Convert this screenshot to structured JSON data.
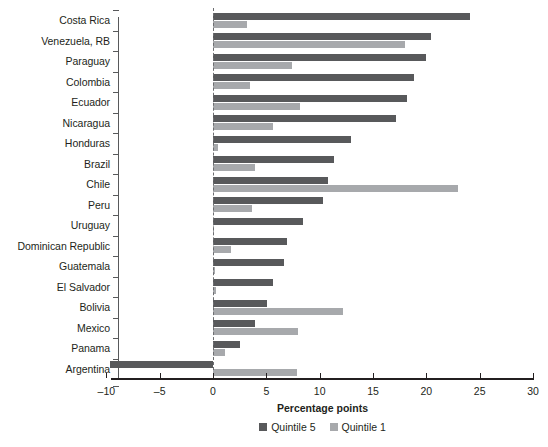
{
  "chart_data": {
    "type": "bar",
    "orientation": "horizontal",
    "title": "",
    "subtitle": "",
    "xlabel": "Percentage points",
    "ylabel": "",
    "xlim": [
      -10,
      30
    ],
    "xticks": [
      -10,
      -5,
      0,
      5,
      10,
      15,
      20,
      25,
      30
    ],
    "xtick_labels": [
      "–10",
      "–5",
      "0",
      "5",
      "10",
      "15",
      "20",
      "25",
      "30"
    ],
    "grid": false,
    "zero_line": true,
    "legend_position": "bottom",
    "categories": [
      "Costa Rica",
      "Venezuela, RB",
      "Paraguay",
      "Colombia",
      "Ecuador",
      "Nicaragua",
      "Honduras",
      "Brazil",
      "Chile",
      "Peru",
      "Uruguay",
      "Dominican Republic",
      "Guatemala",
      "El Salvador",
      "Bolivia",
      "Mexico",
      "Panama",
      "Argentina"
    ],
    "series": [
      {
        "name": "Quintile 5",
        "color": "#58595b",
        "values": [
          24.1,
          20.4,
          20.0,
          18.8,
          18.2,
          17.2,
          12.9,
          11.3,
          10.8,
          10.3,
          8.4,
          6.9,
          6.7,
          5.6,
          5.1,
          3.9,
          2.5,
          -9.7
        ]
      },
      {
        "name": "Quintile 1",
        "color": "#a7a9ac",
        "values": [
          3.2,
          18.0,
          7.4,
          3.5,
          8.2,
          5.6,
          0.5,
          3.9,
          23.0,
          3.7,
          0.1,
          1.7,
          0.2,
          0.3,
          12.2,
          8.0,
          1.1,
          7.9
        ]
      }
    ]
  },
  "legend": {
    "items": [
      {
        "label": "Quintile 5",
        "color": "#58595b"
      },
      {
        "label": "Quintile 1",
        "color": "#a7a9ac"
      }
    ]
  },
  "axis": {
    "x_title": "Percentage points"
  }
}
